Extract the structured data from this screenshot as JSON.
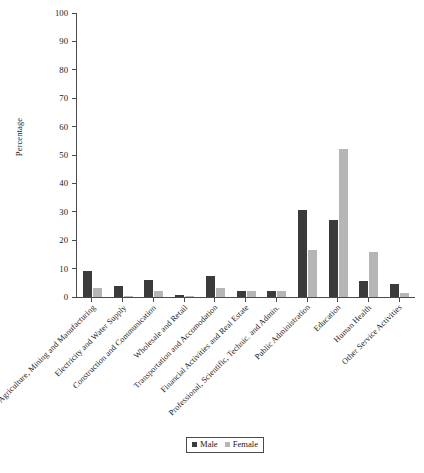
{
  "chart_data": {
    "type": "bar",
    "title": "",
    "xlabel": "",
    "ylabel": "Percentage",
    "ylim": [
      0,
      100
    ],
    "yticks": [
      0,
      10,
      20,
      30,
      40,
      50,
      60,
      70,
      80,
      90,
      100
    ],
    "grid": false,
    "legend_position": "bottom-center",
    "categories": [
      "Agriculture, Mining and Manufacturing",
      "Electricity and Water Supply",
      "Construction and Communication",
      "Wholesale and Retail",
      "Transportation and Accomodation",
      "Financial Activities and Real Estate",
      "Professional, Scientific, Technic. and Admin.",
      "Public Administration",
      "Education",
      "Human Health",
      "Other Service Activities"
    ],
    "series": [
      {
        "name": "Male",
        "color": "#3b3b3b",
        "values": [
          9,
          4,
          6,
          0.6,
          7.5,
          2,
          2,
          30.7,
          27,
          5.5,
          4.5
        ]
      },
      {
        "name": "Female",
        "color": "#b6b6b6",
        "values": [
          3,
          0.4,
          2,
          0.5,
          3,
          2,
          2.2,
          16.5,
          52,
          16,
          1.5
        ]
      }
    ]
  },
  "legend": {
    "items": [
      {
        "label": "Male"
      },
      {
        "label": "Female"
      }
    ]
  },
  "colors": {
    "male": "#3b3b3b",
    "female": "#b6b6b6",
    "axis": "#4a4a4a",
    "background": "#ffffff"
  }
}
